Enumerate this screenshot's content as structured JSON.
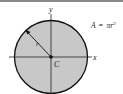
{
  "diagram": {
    "formula": "A = πr²",
    "formula_parts": {
      "lhs": "A",
      "eq": "=",
      "pi": "π",
      "r": "r",
      "exp": "2"
    },
    "labels": {
      "x_axis": "x",
      "y_axis": "y",
      "centroid": "C",
      "radius": "r"
    },
    "colors": {
      "fill": "#c8c8c8",
      "stroke": "#111111",
      "axis": "#222222",
      "top_rule": "#8a8a8a"
    }
  }
}
